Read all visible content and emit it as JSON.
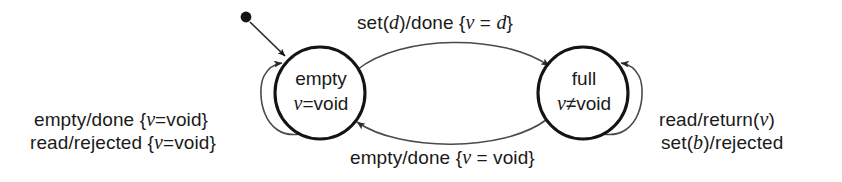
{
  "diagram": {
    "type": "state-machine",
    "colors": {
      "stroke": "#141414",
      "arc": "#3a3a3a",
      "text": "#1a1a1a",
      "background": "#ffffff"
    },
    "states": [
      {
        "id": "empty",
        "name": "empty",
        "condition_var": "v",
        "condition_rest": "=void",
        "initial": true,
        "cx": 320,
        "cy": 93,
        "r": 45
      },
      {
        "id": "full",
        "name": "full",
        "condition_var": "v",
        "condition_rest": "≠void",
        "initial": false,
        "cx": 583,
        "cy": 93,
        "r": 45
      }
    ],
    "initial_marker": {
      "name": "initial-state-dot",
      "x": 246,
      "y": 17
    },
    "transitions": [
      {
        "id": "empty-to-full",
        "from": "empty",
        "to": "full",
        "position": "top",
        "label_parts": [
          {
            "text": "set(",
            "italic": false
          },
          {
            "text": "d",
            "italic": true
          },
          {
            "text": ")/done {",
            "italic": false
          },
          {
            "text": "v",
            "italic": true
          },
          {
            "text": " = ",
            "italic": false
          },
          {
            "text": "d",
            "italic": true
          },
          {
            "text": "}",
            "italic": false
          }
        ],
        "label_plain": "set(d)/done {v = d}"
      },
      {
        "id": "full-to-empty",
        "from": "full",
        "to": "empty",
        "position": "bottom",
        "label_parts": [
          {
            "text": "empty/done {",
            "italic": false
          },
          {
            "text": "v",
            "italic": true
          },
          {
            "text": " = void}",
            "italic": false
          }
        ],
        "label_plain": "empty/done {v = void}"
      },
      {
        "id": "empty-self-loop-1",
        "from": "empty",
        "to": "empty",
        "position": "left",
        "label_parts": [
          {
            "text": "empty/done {",
            "italic": false
          },
          {
            "text": "v",
            "italic": true
          },
          {
            "text": "=void}",
            "italic": false
          }
        ],
        "label_plain": "empty/done {v=void}"
      },
      {
        "id": "empty-self-loop-2",
        "from": "empty",
        "to": "empty",
        "position": "left",
        "label_parts": [
          {
            "text": "read/rejected {",
            "italic": false
          },
          {
            "text": "v",
            "italic": true
          },
          {
            "text": "=void}",
            "italic": false
          }
        ],
        "label_plain": "read/rejected {v=void}"
      },
      {
        "id": "full-self-loop-1",
        "from": "full",
        "to": "full",
        "position": "right",
        "label_parts": [
          {
            "text": "read/return(",
            "italic": false
          },
          {
            "text": "v",
            "italic": true
          },
          {
            "text": ")",
            "italic": false
          }
        ],
        "label_plain": "read/return(v)"
      },
      {
        "id": "full-self-loop-2",
        "from": "full",
        "to": "full",
        "position": "right",
        "label_parts": [
          {
            "text": "set(",
            "italic": false
          },
          {
            "text": "b",
            "italic": true
          },
          {
            "text": ")/rejected",
            "italic": false
          }
        ],
        "label_plain": "set(b)/rejected"
      }
    ]
  }
}
